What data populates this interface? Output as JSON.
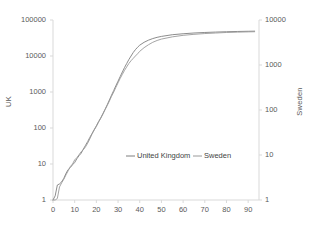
{
  "chart_data": {
    "type": "line",
    "title": "",
    "xlabel": "",
    "ylabel": "UK",
    "y2label": "Sweden",
    "grid": false,
    "yscale": "log",
    "y2scale": "log",
    "ylim": [
      1,
      100000
    ],
    "y2lim": [
      1,
      10000
    ],
    "xlim": [
      0,
      95
    ],
    "xticks": [
      0,
      10,
      20,
      30,
      40,
      50,
      60,
      70,
      80,
      90
    ],
    "yticks": [
      1,
      10,
      100,
      1000,
      10000,
      100000
    ],
    "y2ticks": [
      1,
      10,
      100,
      1000,
      10000
    ],
    "legend_position": "center-right-inside",
    "line_color": "#808080",
    "axis_color": "#d9d9d9",
    "text_color": "#5a5a5a",
    "series": [
      {
        "name": "United Kingdom",
        "color": "#7f7f7f",
        "x": [
          0,
          1,
          2,
          3,
          4,
          5,
          6,
          7,
          8,
          9,
          10,
          11,
          12,
          13,
          14,
          15,
          16,
          17,
          18,
          19,
          20,
          21,
          22,
          23,
          24,
          25,
          26,
          27,
          28,
          29,
          30,
          31,
          32,
          33,
          34,
          35,
          36,
          37,
          38,
          39,
          40,
          42,
          44,
          46,
          48,
          50,
          55,
          60,
          65,
          70,
          75,
          80,
          85,
          90,
          93
        ],
        "values": [
          1,
          1.3,
          2.6,
          2.8,
          3.2,
          4,
          5.5,
          7,
          8,
          9.5,
          11,
          14,
          17,
          20,
          26,
          33,
          42,
          55,
          70,
          90,
          115,
          150,
          190,
          250,
          330,
          440,
          600,
          820,
          1100,
          1500,
          2000,
          2700,
          3600,
          4800,
          6200,
          8000,
          10000,
          12500,
          15000,
          17500,
          20000,
          24000,
          27500,
          30500,
          33000,
          35000,
          39000,
          41500,
          43500,
          45000,
          46200,
          47200,
          48000,
          48600,
          49000
        ]
      },
      {
        "name": "Sweden",
        "color": "#9a9a9a",
        "x": [
          0,
          1,
          2,
          3,
          4,
          5,
          6,
          7,
          8,
          9,
          10,
          11,
          12,
          13,
          14,
          15,
          16,
          17,
          18,
          19,
          20,
          21,
          22,
          23,
          24,
          25,
          26,
          27,
          28,
          29,
          30,
          31,
          32,
          33,
          34,
          35,
          36,
          37,
          38,
          39,
          40,
          42,
          44,
          46,
          48,
          50,
          55,
          60,
          65,
          70,
          75,
          80,
          85,
          90,
          93
        ],
        "values": [
          1,
          1,
          1.1,
          2.3,
          3,
          3.8,
          5,
          6.5,
          8.5,
          10,
          13,
          15,
          18,
          22,
          25,
          30,
          38,
          50,
          68,
          88,
          110,
          145,
          185,
          240,
          320,
          420,
          560,
          760,
          1000,
          1350,
          1800,
          2400,
          3100,
          4000,
          5000,
          6200,
          7400,
          8600,
          10000,
          11500,
          13500,
          17000,
          20500,
          24000,
          27000,
          29500,
          34000,
          37500,
          40000,
          42000,
          43500,
          45000,
          46000,
          46800,
          47200
        ]
      }
    ]
  },
  "legend": {
    "items": [
      {
        "label": "United Kingdom",
        "color": "#7f7f7f"
      },
      {
        "label": "Sweden",
        "color": "#9a9a9a"
      }
    ]
  },
  "axes": {
    "left": {
      "title": "UK",
      "tick_labels": [
        "100000",
        "10000",
        "1000",
        "100",
        "10",
        "1"
      ]
    },
    "right": {
      "title": "Sweden",
      "tick_labels": [
        "10000",
        "1000",
        "100",
        "10",
        "1"
      ]
    },
    "bottom": {
      "tick_labels": [
        "0",
        "10",
        "20",
        "30",
        "40",
        "50",
        "60",
        "70",
        "80",
        "90"
      ]
    }
  }
}
